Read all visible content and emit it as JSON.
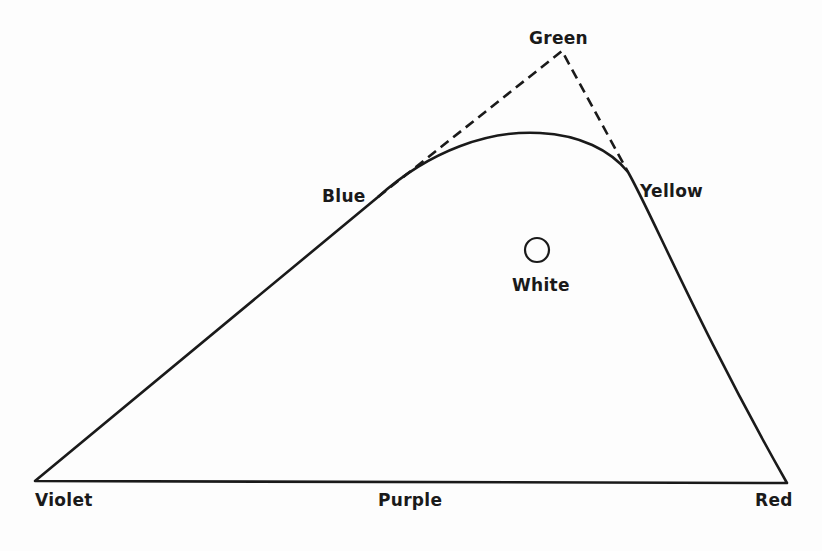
{
  "diagram": {
    "type": "color-gamut-curve",
    "stroke_color": "#1a1a1a",
    "background": "#fdfdfd",
    "labels": {
      "green": "Green",
      "blue": "Blue",
      "yellow": "Yellow",
      "white": "White",
      "violet": "Violet",
      "purple": "Purple",
      "red": "Red"
    },
    "points": {
      "violet": [
        35,
        481
      ],
      "blue": [
        378,
        197
      ],
      "green": [
        562,
        51
      ],
      "yellow": [
        628,
        172
      ],
      "red": [
        787,
        483
      ],
      "white": [
        537,
        250
      ]
    },
    "edges": [
      {
        "from": "violet",
        "to": "blue",
        "style": "solid"
      },
      {
        "from": "blue",
        "to": "yellow",
        "style": "solid-curve"
      },
      {
        "from": "yellow",
        "to": "red",
        "style": "solid"
      },
      {
        "from": "red",
        "to": "violet",
        "style": "solid",
        "label": "Purple"
      },
      {
        "from": "blue",
        "to": "green",
        "style": "dashed"
      },
      {
        "from": "green",
        "to": "yellow",
        "style": "dashed"
      }
    ]
  }
}
